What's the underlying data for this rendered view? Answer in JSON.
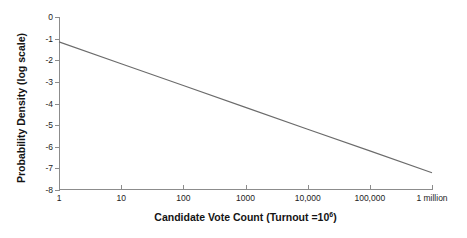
{
  "chart_data": {
    "type": "line",
    "title": "",
    "xlabel": "Candidate Vote Count (Turnout =10",
    "xlabel_exponent": "6",
    "xlabel_suffix": ")",
    "ylabel": "Probability Density (log scale)",
    "xscale": "log",
    "yscale": "linear",
    "xlim": [
      1,
      1000000
    ],
    "ylim": [
      -8,
      0
    ],
    "grid": false,
    "legend": null,
    "x_tick_labels": [
      "1",
      "10",
      "100",
      "1000",
      "10,000",
      "100,000",
      "1 million"
    ],
    "x_tick_values": [
      1,
      10,
      100,
      1000,
      10000,
      100000,
      1000000
    ],
    "y_tick_labels": [
      "0",
      "-1",
      "-2",
      "-3",
      "-4",
      "-5",
      "-6",
      "-7",
      "-8"
    ],
    "y_tick_values": [
      0,
      -1,
      -2,
      -3,
      -4,
      -5,
      -6,
      -7,
      -8
    ],
    "series": [
      {
        "name": "probability density",
        "color": "#6b6b6b",
        "x": [
          1,
          10,
          100,
          1000,
          10000,
          100000,
          1000000
        ],
        "y": [
          -1.15,
          -2.16,
          -3.17,
          -4.18,
          -5.19,
          -6.19,
          -7.2
        ]
      }
    ]
  },
  "colors": {
    "background": "#ffffff",
    "axis": "#8c8c8c",
    "series": "#6b6b6b",
    "text": "#1c1c1c"
  }
}
